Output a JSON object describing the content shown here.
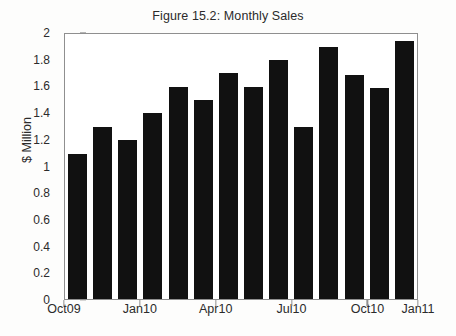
{
  "chart_data": {
    "type": "bar",
    "title": "Figure 15.2: Monthly Sales",
    "xlabel": "",
    "ylabel": "$ Million",
    "ylim": [
      0,
      2
    ],
    "ytick_values": [
      0,
      0.2,
      0.4,
      0.6,
      0.8,
      1,
      1.2,
      1.4,
      1.6,
      1.8,
      2
    ],
    "ytick_labels": [
      "0",
      "0.2",
      "0.4",
      "0.6",
      "0.8",
      "1",
      "1.2",
      "1.4",
      "1.6",
      "1.8",
      "2"
    ],
    "xtick_labels": [
      "Oct09",
      "Jan10",
      "Apr10",
      "Jul10",
      "Oct10",
      "Jan11"
    ],
    "xtick_bar_indices": [
      0,
      3,
      6,
      9,
      12,
      14
    ],
    "grid": false,
    "legend": null,
    "bar_color": "#111111",
    "axis_color": "#8f8f8f",
    "background_color": "#fdfdfc",
    "plot_background_color": "#ffffff",
    "categories": [
      "Oct09",
      "Nov09",
      "Dec09",
      "Jan10",
      "Feb10",
      "Mar10",
      "Apr10",
      "May10",
      "Jun10",
      "Jul10",
      "Aug10",
      "Sep10",
      "Oct10",
      "Nov10"
    ],
    "values": [
      1.09,
      1.29,
      1.19,
      1.39,
      1.59,
      1.49,
      1.69,
      1.59,
      1.79,
      1.29,
      1.89,
      1.68,
      1.58,
      1.93
    ]
  }
}
